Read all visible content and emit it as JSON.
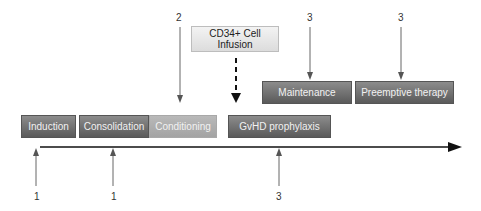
{
  "phases": {
    "induction": "Induction",
    "consolidation": "Consolidation",
    "conditioning": "Conditioning",
    "gvhd": "GvHD prophylaxis",
    "maintenance": "Maintenance",
    "preemptive": "Preemptive therapy",
    "cd34_line1": "CD34+ Cell",
    "cd34_line2": "Infusion"
  },
  "labels": {
    "induction_num": "1",
    "consolidation_num": "1",
    "gvhd_num": "3",
    "conditioning_num": "2",
    "maintenance_num": "3",
    "preemptive_num": "3"
  },
  "colors": {
    "dark_box": "#6e6e6e",
    "light_box": "#adadad",
    "pale_box": "#e8e8e8",
    "arrow": "#555555",
    "timeline": "#111111"
  }
}
